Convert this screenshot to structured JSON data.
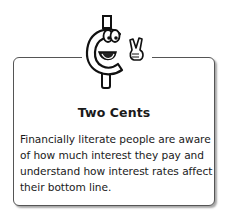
{
  "callout": {
    "icon": "cent-mascot-peace-sign-icon",
    "title": "Two Cents",
    "body": "Financially literate people are aware of how much interest they pay and understand how interest rates affect their bottom line."
  }
}
